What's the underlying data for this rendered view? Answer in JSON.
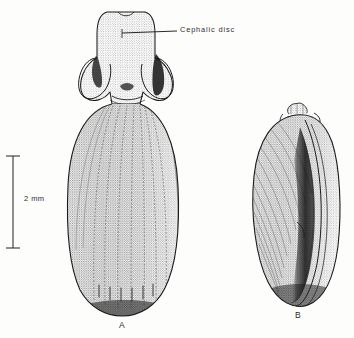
{
  "plate": {
    "background_color": "#fdfdfc",
    "ink_color": "#1b1b1b",
    "medium": "pen-and-ink stipple illustration",
    "subject": "gastropod mollusc, whole animal and shell"
  },
  "annotations": {
    "cephalic_disc_label": "Cephalic disc"
  },
  "scale_bar": {
    "label": "2 mm",
    "value": 2,
    "unit": "mm"
  },
  "figures": [
    {
      "id": "A",
      "label": "A",
      "description": "whole animal, dorsal view with cephalic disc and lateral lobes"
    },
    {
      "id": "B",
      "label": "B",
      "description": "shell, apertural view with apical spire"
    }
  ]
}
